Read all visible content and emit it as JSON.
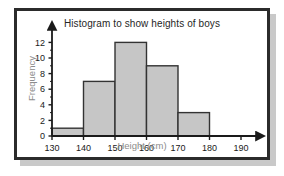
{
  "figure": {
    "background": "#ffffff",
    "frame_color": "#2b2b2b",
    "shadow_color": "#c9c9c9"
  },
  "labels": {
    "title": "Histogram to show heights of boys",
    "ylabel": "Frequency",
    "xlabel": "Height (cm)"
  },
  "chart_data": {
    "type": "bar",
    "title": "Histogram to show heights of boys",
    "xlabel": "Height (cm)",
    "ylabel": "Frequency",
    "categories": [
      "130-140",
      "140-150",
      "150-160",
      "160-170",
      "170-180"
    ],
    "bin_edges": [
      130,
      140,
      150,
      160,
      170,
      180
    ],
    "values": [
      1,
      7,
      12,
      9,
      3
    ],
    "xlim": [
      130,
      190
    ],
    "ylim": [
      0,
      13
    ],
    "xticks": [
      130,
      140,
      150,
      160,
      170,
      180,
      190
    ],
    "yticks": [
      0,
      2,
      4,
      6,
      8,
      10,
      12
    ],
    "xtick_labels": [
      "130",
      "140",
      "150",
      "160",
      "170",
      "180",
      "190"
    ],
    "ytick_labels": [
      "0",
      "2",
      "4",
      "6",
      "8",
      "10",
      "12"
    ],
    "minor_yticks": [
      1,
      3,
      5,
      7,
      9,
      11
    ],
    "grid": false,
    "legend": false,
    "bar_fill": "#c6c6c6",
    "bar_edge": "#333333",
    "axis_color": "#1a1a1a",
    "axis_arrows": true
  }
}
